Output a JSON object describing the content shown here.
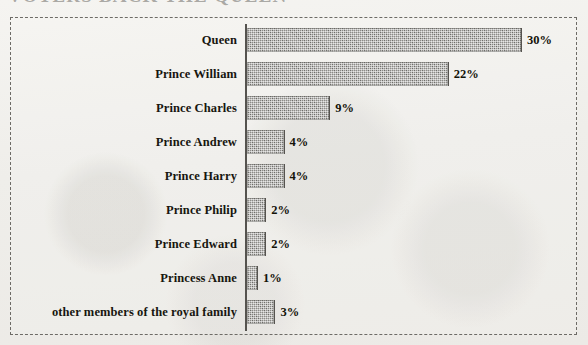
{
  "page": {
    "clipped_heading_sliver": "VOTERS BACK THE QUEEN"
  },
  "chart_data": {
    "type": "bar",
    "orientation": "horizontal",
    "title": "",
    "subtitle": "",
    "xlabel": "",
    "ylabel": "",
    "xlim": [
      0,
      30
    ],
    "grid": false,
    "legend": false,
    "value_suffix": "%",
    "categories": [
      "Queen",
      "Prince William",
      "Prince Charles",
      "Prince Andrew",
      "Prince Harry",
      "Prince Philip",
      "Prince Edward",
      "Princess Anne",
      "other members of the royal family"
    ],
    "values": [
      30,
      22,
      9,
      4,
      4,
      2,
      2,
      1,
      3
    ],
    "value_labels": [
      "30%",
      "22%",
      "9%",
      "4%",
      "4%",
      "2%",
      "2%",
      "1%",
      "3%"
    ],
    "bars": [
      {
        "label": "Queen",
        "value": 30,
        "value_label": "30%"
      },
      {
        "label": "Prince William",
        "value": 22,
        "value_label": "22%"
      },
      {
        "label": "Prince Charles",
        "value": 9,
        "value_label": "9%"
      },
      {
        "label": "Prince Andrew",
        "value": 4,
        "value_label": "4%"
      },
      {
        "label": "Prince Harry",
        "value": 4,
        "value_label": "4%"
      },
      {
        "label": "Prince Philip",
        "value": 2,
        "value_label": "2%"
      },
      {
        "label": "Prince Edward",
        "value": 2,
        "value_label": "2%"
      },
      {
        "label": "Princess Anne",
        "value": 1,
        "value_label": "1%"
      },
      {
        "label": "other members of the royal family",
        "value": 3,
        "value_label": "3%"
      }
    ],
    "colors": {
      "bar_fill": "#8c8b87",
      "bar_edge": "#55534f",
      "axis": "#55534f",
      "frame": "#6d6b66",
      "text": "#17160f",
      "background": "#f2f1ee"
    }
  }
}
